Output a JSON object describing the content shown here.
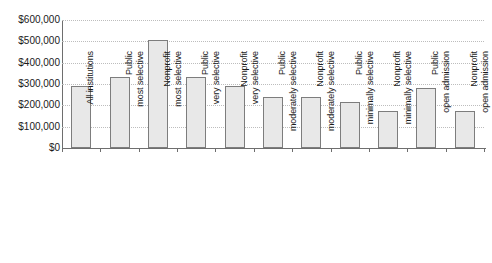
{
  "chart_data": {
    "type": "bar",
    "title": "",
    "xlabel": "",
    "ylabel": "",
    "ylim": [
      0,
      600000
    ],
    "ytick_step": 100000,
    "grid": true,
    "legend": false,
    "legend_position": "none",
    "y_tick_labels": [
      "$600,000",
      "$500,000",
      "$400,000",
      "$300,000",
      "$200,000",
      "$100,000",
      "$0"
    ],
    "y_tick_values": [
      600000,
      500000,
      400000,
      300000,
      200000,
      100000,
      0
    ],
    "categories": [
      "All institutions",
      "Public most selective",
      "Nonprofit most selective",
      "Public very selective",
      "Nonprofit very selective",
      "Public moderately selective",
      "Nonprofit moderately selective",
      "Public minimally selective",
      "Nonprofit minimally selective",
      "Public open admission",
      "Nonprofit open admission"
    ],
    "values": [
      290000,
      335000,
      505000,
      335000,
      290000,
      240000,
      240000,
      215000,
      175000,
      280000,
      175000
    ],
    "bar_fill_color": "#e8e8e8",
    "bar_border_color": "#7d7d7d",
    "gridline_color": "#bdbdbd",
    "axis_color": "#6e6e6e",
    "background_color": "#ffffff"
  }
}
